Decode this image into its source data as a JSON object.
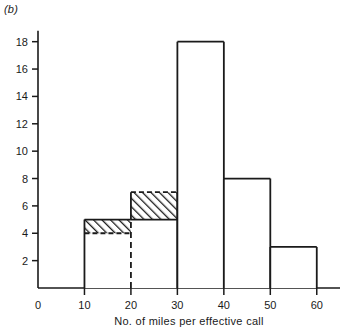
{
  "panel": {
    "label": "(b)"
  },
  "chart_data": {
    "type": "bar",
    "title": "",
    "subtitle": "",
    "xlabel": "No. of miles per effective call",
    "ylabel": "",
    "grid": false,
    "legend": null,
    "xlim": [
      0,
      65
    ],
    "ylim": [
      0,
      19
    ],
    "xticks": [
      0,
      10,
      20,
      30,
      40,
      50,
      60
    ],
    "yticks": [
      0,
      2,
      4,
      6,
      8,
      10,
      12,
      14,
      16,
      18
    ],
    "bin_width": 10,
    "categories": [
      "10-20",
      "20-30",
      "30-40",
      "40-50",
      "50-60"
    ],
    "values": [
      5,
      7,
      18,
      8,
      3
    ],
    "bars": [
      {
        "bin_start": 10,
        "bin_end": 20,
        "value": 5,
        "solid_to": 4,
        "hatch_from": 4,
        "hatch_to": 5,
        "hatch_top_style": "solid",
        "hatch_bottom_style": "dashed"
      },
      {
        "bin_start": 20,
        "bin_end": 30,
        "value": 7,
        "solid_to": 5,
        "hatch_from": 5,
        "hatch_to": 7,
        "hatch_top_style": "dashed",
        "hatch_bottom_style": "solid"
      },
      {
        "bin_start": 30,
        "bin_end": 40,
        "value": 18,
        "solid_to": 18,
        "hatch_from": null,
        "hatch_to": null,
        "hatch_top_style": "none",
        "hatch_bottom_style": "none"
      },
      {
        "bin_start": 40,
        "bin_end": 50,
        "value": 8,
        "solid_to": 8,
        "hatch_from": null,
        "hatch_to": null,
        "hatch_top_style": "none",
        "hatch_bottom_style": "none"
      },
      {
        "bin_start": 50,
        "bin_end": 60,
        "value": 3,
        "solid_to": 3,
        "hatch_from": null,
        "hatch_to": null,
        "hatch_top_style": "none",
        "hatch_bottom_style": "none"
      }
    ],
    "dashed_divider_x": 20,
    "annotations": [],
    "colors": {
      "line": "#1a1a1a",
      "hatch": "#1a1a1a",
      "fill": "#ffffff",
      "background": "#ffffff"
    }
  },
  "xtick_labels": [
    "0",
    "10",
    "20",
    "30",
    "40",
    "50",
    "60"
  ],
  "ytick_labels": [
    "2",
    "4",
    "6",
    "8",
    "10",
    "12",
    "14",
    "16",
    "18"
  ],
  "origin_label": "0",
  "axis_title_x": "No. of miles per effective call"
}
